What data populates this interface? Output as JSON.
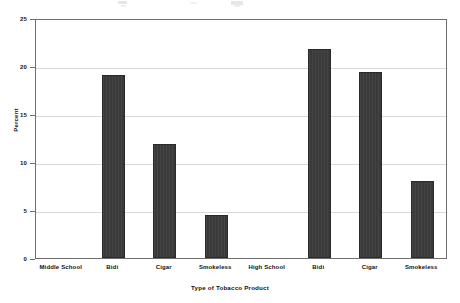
{
  "chart_data": {
    "type": "bar",
    "title": "",
    "xlabel": "Type of Tobacco Product",
    "ylabel": "Percent",
    "categories": [
      "Middle School",
      "Bidi",
      "Cigar",
      "Smokeless",
      "High School",
      "Bidi",
      "Cigar",
      "Smokeless"
    ],
    "values": [
      null,
      19.1,
      11.9,
      4.5,
      null,
      21.8,
      19.4,
      8.0
    ],
    "group_labels": [
      "Middle School",
      "High School"
    ],
    "groups": [
      {
        "name": "Middle School",
        "categories": [
          "Bidi",
          "Cigar",
          "Smokeless"
        ],
        "values": [
          19.1,
          11.9,
          4.5
        ]
      },
      {
        "name": "High School",
        "categories": [
          "Bidi",
          "Cigar",
          "Smokeless"
        ],
        "values": [
          21.8,
          19.4,
          8.0
        ]
      }
    ],
    "ylim": [
      0,
      25
    ],
    "yticks": [
      0,
      5,
      10,
      15,
      20,
      25
    ],
    "ytick_labels": [
      "0",
      "5",
      "10",
      "15",
      "20",
      "25"
    ],
    "grid": true,
    "legend": false,
    "bar_color": "#3a3a3a",
    "gridline_color": "#d9d9d9",
    "axis_color": "#6e6e6e",
    "background": "#ffffff"
  },
  "axis": {
    "y_title": "Percent",
    "x_title": "Type of Tobacco Product"
  }
}
